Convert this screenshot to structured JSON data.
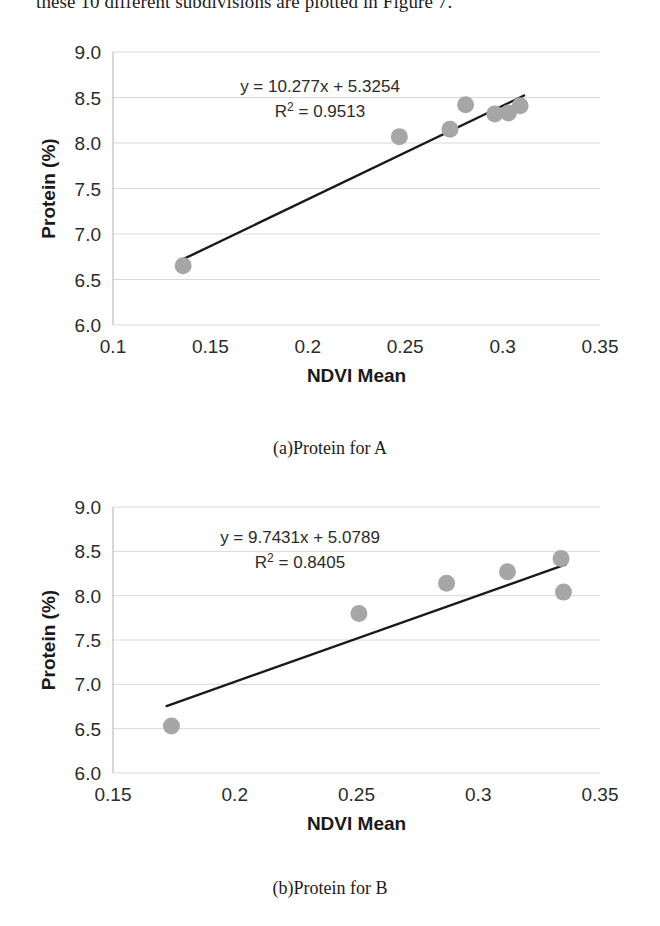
{
  "document": {
    "body_text_line": "these 10 different subdivisions are plotted in Figure 7."
  },
  "figures": [
    {
      "caption": "(a)Protein for A",
      "chart_data": {
        "type": "scatter",
        "title": "",
        "xlabel": "NDVI Mean",
        "ylabel": "Protein (%)",
        "xlim": [
          0.1,
          0.35
        ],
        "ylim": [
          6.0,
          9.0
        ],
        "xticks": [
          "0.1",
          "0.15",
          "0.2",
          "0.25",
          "0.3",
          "0.35"
        ],
        "xtick_values": [
          0.1,
          0.15,
          0.2,
          0.25,
          0.3,
          0.35
        ],
        "yticks": [
          "6.0",
          "6.5",
          "7.0",
          "7.5",
          "8.0",
          "8.5",
          "9.0"
        ],
        "ytick_values": [
          6.0,
          6.5,
          7.0,
          7.5,
          8.0,
          8.5,
          9.0
        ],
        "grid": "horizontal",
        "legend": "none",
        "marker_color": "#a6a6a6",
        "line_color": "#1a1a1a",
        "points": [
          {
            "x": 0.136,
            "y": 6.65
          },
          {
            "x": 0.247,
            "y": 8.07
          },
          {
            "x": 0.273,
            "y": 8.15
          },
          {
            "x": 0.281,
            "y": 8.42
          },
          {
            "x": 0.296,
            "y": 8.32
          },
          {
            "x": 0.303,
            "y": 8.33
          },
          {
            "x": 0.309,
            "y": 8.41
          }
        ],
        "trendline": {
          "slope": 10.277,
          "intercept": 5.3254,
          "x_start": 0.136,
          "x_end": 0.311,
          "equation": "y = 10.277x + 5.3254",
          "r_squared_label": "R",
          "r_squared_sup": "2",
          "r_squared_value": "= 0.9513"
        }
      }
    },
    {
      "caption": "(b)Protein for B",
      "chart_data": {
        "type": "scatter",
        "title": "",
        "xlabel": "NDVI Mean",
        "ylabel": "Protein (%)",
        "xlim": [
          0.15,
          0.35
        ],
        "ylim": [
          6.0,
          9.0
        ],
        "xticks": [
          "0.15",
          "0.2",
          "0.25",
          "0.3",
          "0.35"
        ],
        "xtick_values": [
          0.15,
          0.2,
          0.25,
          0.3,
          0.35
        ],
        "yticks": [
          "6.0",
          "6.5",
          "7.0",
          "7.5",
          "8.0",
          "8.5",
          "9.0"
        ],
        "ytick_values": [
          6.0,
          6.5,
          7.0,
          7.5,
          8.0,
          8.5,
          9.0
        ],
        "grid": "horizontal",
        "legend": "none",
        "marker_color": "#a6a6a6",
        "line_color": "#1a1a1a",
        "points": [
          {
            "x": 0.174,
            "y": 6.53
          },
          {
            "x": 0.251,
            "y": 7.8
          },
          {
            "x": 0.287,
            "y": 8.14
          },
          {
            "x": 0.312,
            "y": 8.27
          },
          {
            "x": 0.334,
            "y": 8.42
          },
          {
            "x": 0.335,
            "y": 8.04
          }
        ],
        "trendline": {
          "slope": 9.7431,
          "intercept": 5.0789,
          "x_start": 0.172,
          "x_end": 0.336,
          "equation": "y = 9.7431x + 5.0789",
          "r_squared_label": "R",
          "r_squared_sup": "2",
          "r_squared_value": "= 0.8405"
        }
      }
    }
  ]
}
